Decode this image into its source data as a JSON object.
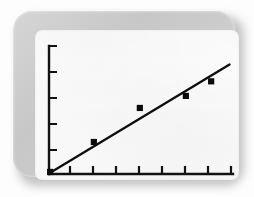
{
  "figure": {
    "frame_style": "rounded-grey-bezel",
    "screen_background": "#fbfbfb",
    "bezel_color": "#cccccc",
    "shadow_color": "#b9b9b9"
  },
  "chart_data": {
    "type": "scatter",
    "title": "",
    "subtitle": "",
    "xlabel": "",
    "ylabel": "",
    "grid": false,
    "legend": false,
    "legend_position": "none",
    "axis_style": "left-and-bottom-spines",
    "tick_labels_visible": false,
    "xlim": [
      0,
      8
    ],
    "ylim": [
      0,
      5
    ],
    "xticks": [
      0,
      1,
      2,
      3,
      4,
      5,
      6,
      7,
      8
    ],
    "yticks": [
      0,
      1,
      2,
      3,
      4,
      5
    ],
    "xticklabels": [
      "",
      "",
      "",
      "",
      "",
      "",
      "",
      "",
      ""
    ],
    "yticklabels": [
      "",
      "",
      "",
      "",
      "",
      ""
    ],
    "marker": "square",
    "marker_color": "#0b0b0b",
    "line_color": "#0d0d0d",
    "series": [
      {
        "name": "observations",
        "type": "scatter",
        "x": [
          0.05,
          1.95,
          3.95,
          5.95,
          7.05
        ],
        "y": [
          0.08,
          1.25,
          2.58,
          3.05,
          3.62
        ]
      },
      {
        "name": "fitted line",
        "type": "line",
        "x": [
          0.05,
          7.85
        ],
        "y": [
          0.05,
          4.28
        ]
      }
    ],
    "point_count": 5,
    "trend": "increasing-linear"
  }
}
